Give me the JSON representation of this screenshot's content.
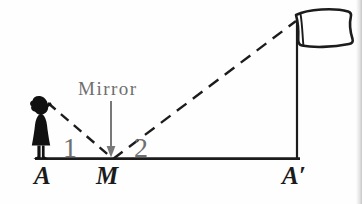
{
  "figure": {
    "labels": {
      "mirror": "Mirror",
      "angle_1": "1",
      "angle_2": "2",
      "point_a": "A",
      "point_m": "M",
      "point_a_prime": "A′"
    },
    "colors": {
      "ink_black": "#1c1c1c",
      "annotation_gray": "#6e6e6e",
      "background": "#fefefe"
    },
    "elements": {
      "girl_icon": "girl standing at point A",
      "flag_icon": "flag on pole at point A′",
      "arrow_icon": "gray arrow pointing down at mirror point M",
      "ray_1": "dashed sight line from girl's eye to mirror at M",
      "ray_2": "dashed reflected line from M to top of flagpole"
    }
  }
}
